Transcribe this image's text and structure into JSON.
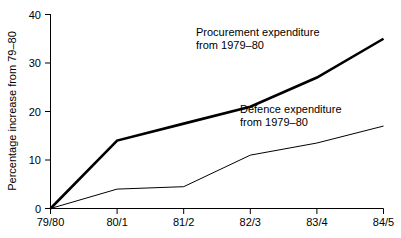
{
  "chart_data": {
    "type": "line",
    "title": "",
    "xlabel": "",
    "ylabel": "Percentage increase from 79–80",
    "categories": [
      "79/80",
      "80/1",
      "81/2",
      "82/3",
      "83/4",
      "84/5"
    ],
    "ylim": [
      0,
      40
    ],
    "yticks": [
      0,
      10,
      20,
      30,
      40
    ],
    "ytick_labels": [
      "0",
      "10",
      "20",
      "30",
      "40"
    ],
    "grid": false,
    "legend_position": "inline-annotations",
    "series": [
      {
        "name": "Procurement expenditure from 1979–80",
        "values": [
          0,
          14,
          17.5,
          21,
          27,
          35
        ],
        "line_width": "thick",
        "color": "#000000"
      },
      {
        "name": "Defence expenditure from 1979–80",
        "values": [
          0,
          4,
          4.5,
          11,
          13.5,
          17
        ],
        "line_width": "thin",
        "color": "#000000"
      }
    ],
    "annotations": [
      {
        "id": "procurement",
        "line1": "Procurement expenditure",
        "line2": "from 1979–80"
      },
      {
        "id": "defence",
        "line1": "Defence expenditure",
        "line2": "from 1979–80"
      }
    ]
  },
  "axis": {
    "ytick_0": "0",
    "ytick_1": "10",
    "ytick_2": "20",
    "ytick_3": "30",
    "ytick_4": "40",
    "xtick_0": "79/80",
    "xtick_1": "80/1",
    "xtick_2": "81/2",
    "xtick_3": "82/3",
    "xtick_4": "83/4",
    "xtick_5": "84/5",
    "y_axis_title": "Percentage increase from 79–80"
  },
  "annotations": {
    "procurement_line1": "Procurement expenditure",
    "procurement_line2": "from 1979–80",
    "defence_line1": "Defence expenditure",
    "defence_line2": "from 1979–80"
  },
  "colors": {
    "ink": "#000000",
    "background": "#ffffff"
  }
}
